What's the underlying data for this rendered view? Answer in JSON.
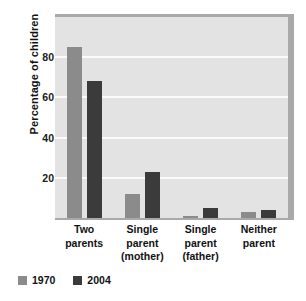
{
  "chart_data": {
    "type": "bar",
    "title": "",
    "subtitle": "",
    "xlabel": "",
    "ylabel": "Percentage of children",
    "ylim": [
      0,
      100
    ],
    "yticks": [
      20,
      40,
      60,
      80
    ],
    "ytick_labels": [
      "20",
      "40",
      "60",
      "80"
    ],
    "grid": true,
    "grid_axis": "y",
    "legend_position": "bottom-left",
    "categories": [
      "Two parents",
      "Single parent (mother)",
      "Single parent (father)",
      "Neither parent"
    ],
    "category_lines": [
      [
        "Two",
        "parents"
      ],
      [
        "Single",
        "parent",
        "(mother)"
      ],
      [
        "Single",
        "parent",
        "(father)"
      ],
      [
        "Neither",
        "parent"
      ]
    ],
    "series": [
      {
        "name": "1970",
        "color": "#8b8b8b",
        "values": [
          85,
          12,
          1,
          3
        ]
      },
      {
        "name": "2004",
        "color": "#3b3b3b",
        "values": [
          68,
          23,
          5,
          4
        ]
      }
    ]
  },
  "axis": {
    "y_title": "Percentage of children",
    "tick_20": "20",
    "tick_40": "40",
    "tick_60": "60",
    "tick_80": "80"
  },
  "categories": {
    "c0_l0": "Two",
    "c0_l1": "parents",
    "c1_l0": "Single",
    "c1_l1": "parent",
    "c1_l2": "(mother)",
    "c2_l0": "Single",
    "c2_l1": "parent",
    "c2_l2": "(father)",
    "c3_l0": "Neither",
    "c3_l1": "parent"
  },
  "legend": {
    "item0_label": "1970",
    "item0_color": "#8b8b8b",
    "item1_label": "2004",
    "item1_color": "#3b3b3b"
  },
  "colors": {
    "plot_background": "#e3e3e3",
    "gridline": "#fbfbfb",
    "plot_shadow": "#a9a9a9",
    "page_background": "#ffffff",
    "text": "#111111"
  }
}
